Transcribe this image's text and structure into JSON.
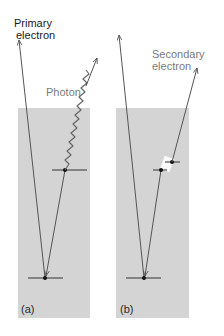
{
  "labels": {
    "primary_line1": "Primary",
    "primary_line2": "electron",
    "photon": "Photon",
    "secondary_line1": "Secondary",
    "secondary_line2": "electron",
    "panel_a": "(a)",
    "panel_b": "(b)"
  },
  "colors": {
    "specimen_fill": "#d4d4d4",
    "line": "#555555",
    "label_dark": "#1a1a1a",
    "label_grey": "#7a7a7a",
    "dot": "#111111"
  }
}
